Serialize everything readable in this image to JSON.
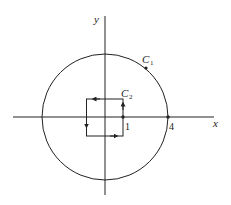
{
  "diagram": {
    "axes": {
      "x_label": "x",
      "y_label": "y"
    },
    "curves": [
      {
        "name": "C",
        "sub": "1",
        "shape": "circle",
        "radius": 4,
        "orientation": "counterclockwise"
      },
      {
        "name": "C",
        "sub": "2",
        "shape": "square",
        "half_side": 1,
        "orientation": "counterclockwise"
      }
    ],
    "point_labels": [
      {
        "text": "1"
      },
      {
        "text": "4"
      }
    ],
    "colors": {
      "stroke": "#222222",
      "background": "#ffffff"
    }
  }
}
